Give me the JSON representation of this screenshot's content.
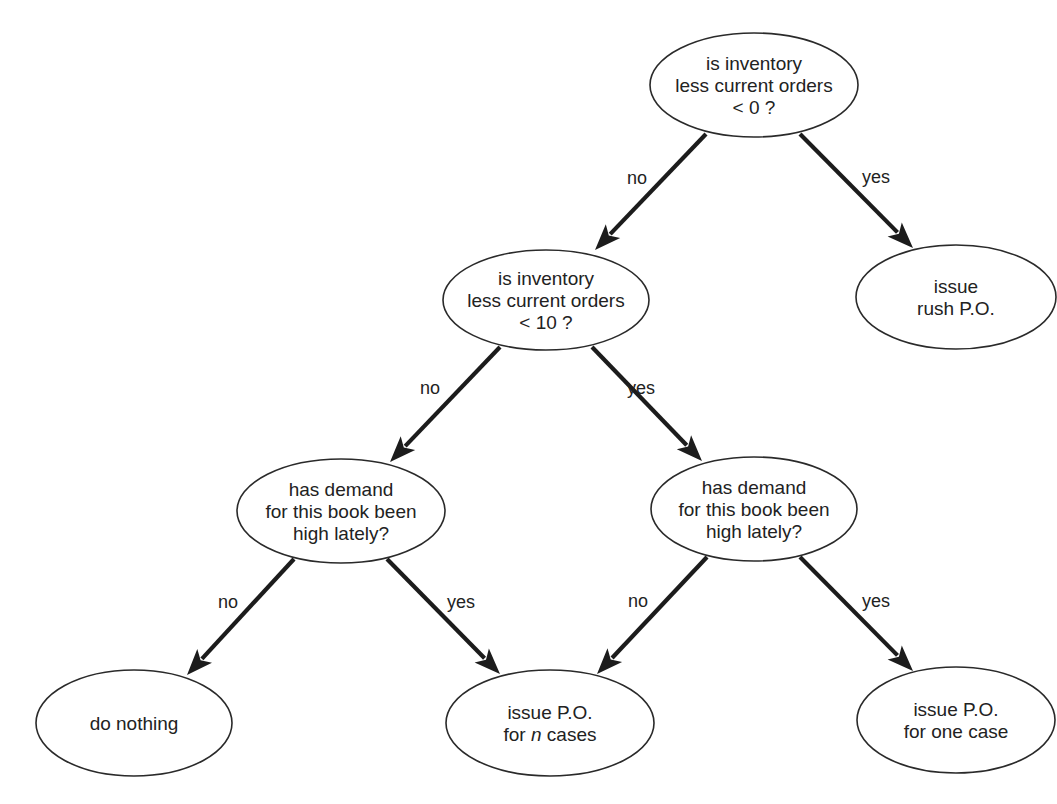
{
  "diagram": {
    "type": "decision-tree",
    "colors": {
      "background": "#ffffff",
      "stroke": "#2a2a2a",
      "arrow": "#1c1c1c",
      "text": "#222222"
    },
    "nodes": [
      {
        "id": "q_inventory_lt_0",
        "kind": "decision",
        "lines": [
          "is inventory",
          "less current orders",
          "< 0 ?"
        ],
        "cx": 754,
        "cy": 85,
        "rx": 104,
        "ry": 52
      },
      {
        "id": "issue_rush_po",
        "kind": "action",
        "lines": [
          "issue",
          "rush P.O."
        ],
        "cx": 956,
        "cy": 297,
        "rx": 100,
        "ry": 52
      },
      {
        "id": "q_inventory_lt_10",
        "kind": "decision",
        "lines": [
          "is inventory",
          "less current orders",
          "< 10 ?"
        ],
        "cx": 546,
        "cy": 300,
        "rx": 103,
        "ry": 50
      },
      {
        "id": "q_demand_left",
        "kind": "decision",
        "lines": [
          "has demand",
          "for this book been",
          "high lately?"
        ],
        "cx": 341,
        "cy": 511,
        "rx": 104,
        "ry": 52
      },
      {
        "id": "q_demand_right",
        "kind": "decision",
        "lines": [
          "has demand",
          "for this book been",
          "high lately?"
        ],
        "cx": 754,
        "cy": 509,
        "rx": 103,
        "ry": 52
      },
      {
        "id": "do_nothing",
        "kind": "action",
        "lines": [
          "do nothing"
        ],
        "cx": 134,
        "cy": 723,
        "rx": 98,
        "ry": 53
      },
      {
        "id": "issue_po_n_cases",
        "kind": "action",
        "lines": [
          "issue P.O.",
          "for n cases"
        ],
        "italic_word": "n",
        "cx": 550,
        "cy": 723,
        "rx": 104,
        "ry": 53
      },
      {
        "id": "issue_po_one_case",
        "kind": "action",
        "lines": [
          "issue P.O.",
          "for one case"
        ],
        "cx": 956,
        "cy": 720,
        "rx": 99,
        "ry": 53
      }
    ],
    "edges": [
      {
        "from": "q_inventory_lt_0",
        "to": "q_inventory_lt_10",
        "label": "no",
        "x1": 706,
        "y1": 134,
        "x2": 595,
        "y2": 250,
        "lx": 637,
        "ly": 184
      },
      {
        "from": "q_inventory_lt_0",
        "to": "issue_rush_po",
        "label": "yes",
        "x1": 800,
        "y1": 134,
        "x2": 913,
        "y2": 248,
        "lx": 876,
        "ly": 183
      },
      {
        "from": "q_inventory_lt_10",
        "to": "q_demand_left",
        "label": "no",
        "x1": 500,
        "y1": 347,
        "x2": 390,
        "y2": 462,
        "lx": 430,
        "ly": 394
      },
      {
        "from": "q_inventory_lt_10",
        "to": "q_demand_right",
        "label": "yes",
        "x1": 592,
        "y1": 347,
        "x2": 702,
        "y2": 461,
        "lx": 641,
        "ly": 394
      },
      {
        "from": "q_demand_left",
        "to": "do_nothing",
        "label": "no",
        "x1": 294,
        "y1": 559,
        "x2": 187,
        "y2": 675,
        "lx": 228,
        "ly": 608
      },
      {
        "from": "q_demand_left",
        "to": "issue_po_n_cases",
        "label": "yes",
        "x1": 387,
        "y1": 559,
        "x2": 500,
        "y2": 674,
        "lx": 461,
        "ly": 608
      },
      {
        "from": "q_demand_right",
        "to": "issue_po_n_cases",
        "label": "no",
        "x1": 707,
        "y1": 557,
        "x2": 597,
        "y2": 674,
        "lx": 638,
        "ly": 607
      },
      {
        "from": "q_demand_right",
        "to": "issue_po_one_case",
        "label": "yes",
        "x1": 800,
        "y1": 557,
        "x2": 913,
        "y2": 671,
        "lx": 876,
        "ly": 607
      }
    ]
  }
}
